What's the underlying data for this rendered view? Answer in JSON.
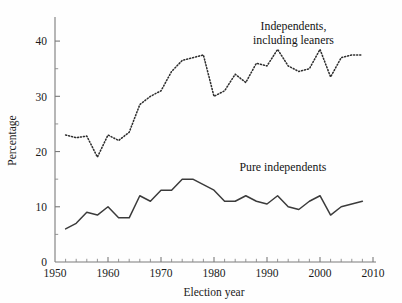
{
  "chart_data": {
    "type": "line",
    "title": "",
    "xlabel": "Election year",
    "ylabel": "Percentage",
    "xlim": [
      1950,
      2010
    ],
    "ylim": [
      0,
      44
    ],
    "grid": false,
    "x_ticks_major": [
      1950,
      1960,
      1970,
      1980,
      1990,
      2000,
      2010
    ],
    "x_tick_labels": [
      "1950",
      "1960",
      "1970",
      "1980",
      "1990",
      "2000",
      "2010"
    ],
    "x_ticks_minor_step": 2,
    "y_ticks_major": [
      0,
      10,
      20,
      30,
      40
    ],
    "y_tick_labels": [
      "0",
      "10",
      "20",
      "30",
      "40"
    ],
    "y_ticks_minor": [
      5,
      15,
      25,
      35
    ],
    "legend_position": "inline-annotations",
    "series": [
      {
        "name": "Independents, including leaners",
        "style": "dotted",
        "color": "#2e2e2e",
        "x": [
          1952,
          1954,
          1956,
          1958,
          1960,
          1962,
          1964,
          1966,
          1968,
          1970,
          1972,
          1974,
          1976,
          1978,
          1980,
          1982,
          1984,
          1986,
          1988,
          1990,
          1992,
          1994,
          1996,
          1998,
          2000,
          2002,
          2004,
          2006,
          2008
        ],
        "values": [
          23.0,
          22.5,
          22.8,
          19.0,
          23.0,
          22.0,
          23.5,
          28.5,
          30.0,
          31.0,
          34.5,
          36.5,
          37.0,
          37.5,
          30.0,
          31.0,
          34.0,
          32.5,
          36.0,
          35.5,
          38.5,
          35.5,
          34.5,
          35.0,
          38.5,
          33.5,
          37.0,
          37.5,
          37.5
        ]
      },
      {
        "name": "Pure independents",
        "style": "solid",
        "color": "#3b3b3b",
        "x": [
          1952,
          1954,
          1956,
          1958,
          1960,
          1962,
          1964,
          1966,
          1968,
          1970,
          1972,
          1974,
          1976,
          1978,
          1980,
          1982,
          1984,
          1986,
          1988,
          1990,
          1992,
          1994,
          1996,
          1998,
          2000,
          2002,
          2004,
          2006,
          2008
        ],
        "values": [
          6.0,
          7.0,
          9.0,
          8.5,
          10.0,
          8.0,
          8.0,
          12.0,
          11.0,
          13.0,
          13.0,
          15.0,
          15.0,
          14.0,
          13.0,
          11.0,
          11.0,
          12.0,
          11.0,
          10.5,
          12.0,
          10.0,
          9.5,
          11.0,
          12.0,
          8.5,
          10.0,
          10.5,
          11.0
        ]
      }
    ],
    "annotations": [
      {
        "id": "annot-independents",
        "lines": [
          "Independents,",
          "including leaners"
        ],
        "x": 1995,
        "y": 42
      },
      {
        "id": "annot-pure",
        "text": "Pure independents",
        "x": 1993,
        "y": 16.5
      }
    ]
  },
  "labels": {
    "y_axis_title": "Percentage",
    "x_axis_title": "Election year",
    "annot_independents_line1": "Independents,",
    "annot_independents_line2": "including leaners",
    "annot_pure": "Pure independents"
  }
}
